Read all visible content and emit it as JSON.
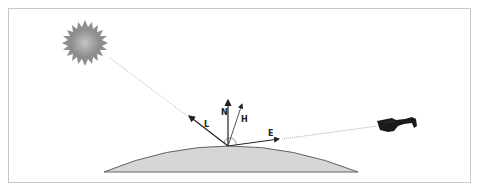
{
  "diagram": {
    "labels": {
      "normal": "N",
      "half_vector": "H",
      "light": "L",
      "eye": "E"
    },
    "elements": [
      "sun (light source)",
      "surface dome",
      "eye / glasses (viewer)"
    ],
    "colors": {
      "background": "#ffffff",
      "frame_border": "#c8c8c8",
      "surface_fill": "#d6d6d6",
      "surface_stroke": "#555555",
      "vector": "#222222",
      "sun": "#9a9a9a",
      "glasses": "#1a1a1a",
      "dotted_line": "#999999"
    }
  }
}
